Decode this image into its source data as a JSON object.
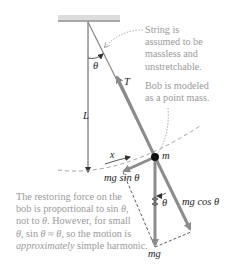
{
  "labels": {
    "theta_top": "θ",
    "tension": "T",
    "length": "L",
    "mass": "m",
    "displacement": "x",
    "mg_sin": "mg sin θ",
    "mg_cos": "mg cos θ",
    "theta_bottom": "θ",
    "weight": "mg"
  },
  "notes": {
    "string_note": [
      "String is",
      "assumed to be",
      "massless and",
      "unstretchable."
    ],
    "bob_note": [
      "Bob is modeled",
      "as a point mass."
    ],
    "restoring_note": {
      "line1": "The restoring force on the",
      "line2_pre": "bob is proportional to sin ",
      "line2_theta": "θ",
      "line2_post": ",",
      "line3_pre": "not to ",
      "line3_theta": "θ",
      "line3_post": ". However, for small",
      "line4_theta1": "θ",
      "line4_mid": ", sin ",
      "line4_theta2": "θ",
      "line4_approx": " ≈ ",
      "line4_theta3": "θ",
      "line4_post": ", so the motion is",
      "line5_italic": "approximately",
      "line5_post": " simple harmonic."
    }
  },
  "colors": {
    "ceiling": "#999999",
    "string": "#888888",
    "force_arrow": "#8c8c8c",
    "note_text": "#9a9a9a",
    "bob": "#111111"
  }
}
